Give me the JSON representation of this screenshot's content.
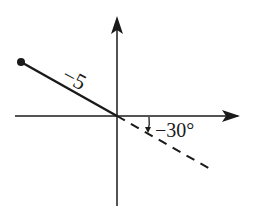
{
  "diagram": {
    "type": "polar-vector",
    "axes": {
      "x_axis": "horizontal axis with arrow pointing right",
      "y_axis": "vertical axis with arrow pointing up"
    },
    "vector": {
      "label": "−5",
      "style": "solid line from origin to filled dot in upper-left (second quadrant)"
    },
    "reference_ray": {
      "style": "dashed",
      "direction": "lower-right (fourth quadrant), opposite to the solid vector"
    },
    "angle": {
      "label": "−30°",
      "description": "clockwise angle measured from positive x-axis down to dashed ray"
    },
    "colors": {
      "ink": "#1a1a1a",
      "background": "#ffffff"
    }
  }
}
